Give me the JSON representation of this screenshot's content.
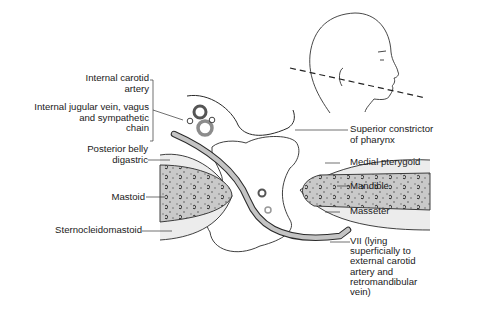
{
  "labels_left": [
    {
      "id": "internal-carotid",
      "lines": [
        "Internal carotid",
        "artery"
      ]
    },
    {
      "id": "ijv-vagus-sympathetic",
      "lines": [
        "Internal jugular vein, vagus",
        "and sympathetic",
        "chain"
      ]
    },
    {
      "id": "posterior-belly-digastric",
      "lines": [
        "Posterior belly",
        "digastric"
      ]
    },
    {
      "id": "mastoid",
      "lines": [
        "Mastoid"
      ]
    },
    {
      "id": "sternocleidomastoid",
      "lines": [
        "Sternocleidomastoid"
      ]
    }
  ],
  "labels_right": [
    {
      "id": "superior-constrictor",
      "lines": [
        "Superior constrictor",
        "of pharynx"
      ]
    },
    {
      "id": "medial-pterygoid",
      "lines": [
        "Medial pterygoid"
      ]
    },
    {
      "id": "mandible",
      "lines": [
        "Mandible"
      ]
    },
    {
      "id": "masseter",
      "lines": [
        "Masseter"
      ]
    },
    {
      "id": "facial-nerve",
      "lines": [
        "VII (lying",
        "superficially to",
        "external carotid",
        "artery and",
        "retromandibular",
        "vein)"
      ]
    }
  ],
  "colors": {
    "line": "#2a2a2a",
    "bone": "#c8c8c8",
    "muscle": "#e4e4e4",
    "vessel_dark": "#555555",
    "vessel_light": "#8a8a8a",
    "nerve": "#bdbdbd"
  }
}
